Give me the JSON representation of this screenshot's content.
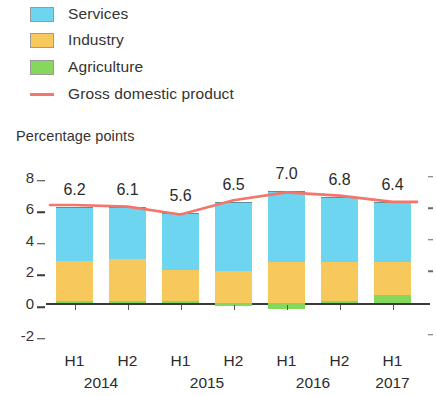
{
  "legend": {
    "items": [
      {
        "label": "Services",
        "color": "#6DD5F0",
        "marker": "swatch"
      },
      {
        "label": "Industry",
        "color": "#F7C95C",
        "marker": "swatch"
      },
      {
        "label": "Agriculture",
        "color": "#86D85C",
        "marker": "swatch"
      },
      {
        "label": "Gross domestic product",
        "color": "#F4756A",
        "marker": "line"
      }
    ]
  },
  "axis_title": "Percentage points",
  "chart_data": {
    "type": "bar",
    "title": "",
    "subtitle": "",
    "xlabel": "",
    "ylabel": "Percentage points",
    "ylim": [
      -2,
      8
    ],
    "yticks": [
      8,
      6,
      4,
      2,
      0,
      -2
    ],
    "ytick_labels": [
      "8",
      "6",
      "4",
      "2",
      "0",
      "-2"
    ],
    "grid": false,
    "legend_position": "top-left",
    "stacked": true,
    "categories": [
      "H1",
      "H2",
      "H1",
      "H2",
      "H1",
      "H2",
      "H1"
    ],
    "category_groups": [
      {
        "year": "2014",
        "halves": [
          "H1",
          "H2"
        ]
      },
      {
        "year": "2015",
        "halves": [
          "H1",
          "H2"
        ]
      },
      {
        "year": "2016",
        "halves": [
          "H1",
          "H2"
        ]
      },
      {
        "year": "2017",
        "halves": [
          "H1"
        ]
      }
    ],
    "series": [
      {
        "name": "Agriculture",
        "color": "#86D85C",
        "values": [
          0.15,
          0.1,
          0.1,
          -0.2,
          -0.35,
          0.1,
          0.5
        ]
      },
      {
        "name": "Industry",
        "color": "#F7C95C",
        "values": [
          2.5,
          2.7,
          2.0,
          2.0,
          2.6,
          2.5,
          2.1
        ]
      },
      {
        "name": "Services",
        "color": "#6DD5F0",
        "values": [
          3.4,
          3.3,
          3.6,
          4.4,
          4.5,
          4.1,
          3.8
        ]
      }
    ],
    "line_series": {
      "name": "Gross domestic product",
      "color": "#F4756A",
      "values": [
        6.2,
        6.1,
        5.6,
        6.5,
        7.0,
        6.8,
        6.4
      ]
    },
    "bar_labels": [
      "6.2",
      "6.1",
      "5.6",
      "6.5",
      "7.0",
      "6.8",
      "6.4"
    ]
  }
}
